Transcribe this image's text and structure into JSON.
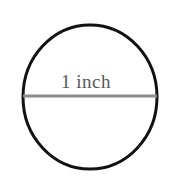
{
  "figure": {
    "background_color": "#ffffff",
    "circle": {
      "name": "circle-outline",
      "center_x": 90,
      "center_y": 97,
      "radius_x": 67,
      "radius_y": 72,
      "stroke_color": "#121212",
      "stroke_width": 3,
      "fill": "none"
    },
    "diameter_line": {
      "name": "diameter-line",
      "x1": 23,
      "y1": 96,
      "x2": 157,
      "y2": 96,
      "stroke_color": "#8c8c8c",
      "stroke_width": 3
    },
    "label": {
      "text": "1 inch",
      "color": "#58585a",
      "font_size": 19,
      "x": 90,
      "y": 83
    }
  },
  "chart_data": {
    "type": "diagram",
    "title": "1 inch",
    "shape": "circle",
    "annotations": [
      {
        "label": "1 inch",
        "measures": "diameter",
        "value": 1,
        "unit": "inch"
      }
    ]
  }
}
